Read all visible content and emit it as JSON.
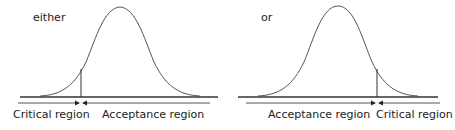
{
  "panels": [
    {
      "title": "either",
      "side": "left-tail",
      "labels": {
        "critical": "Critical region",
        "acceptance": "Acceptance region"
      }
    },
    {
      "title": "or",
      "side": "right-tail",
      "labels": {
        "acceptance": "Acceptance region",
        "critical": "Critical region"
      }
    }
  ],
  "colors": {
    "line": "#333333",
    "curve": "#444444"
  }
}
